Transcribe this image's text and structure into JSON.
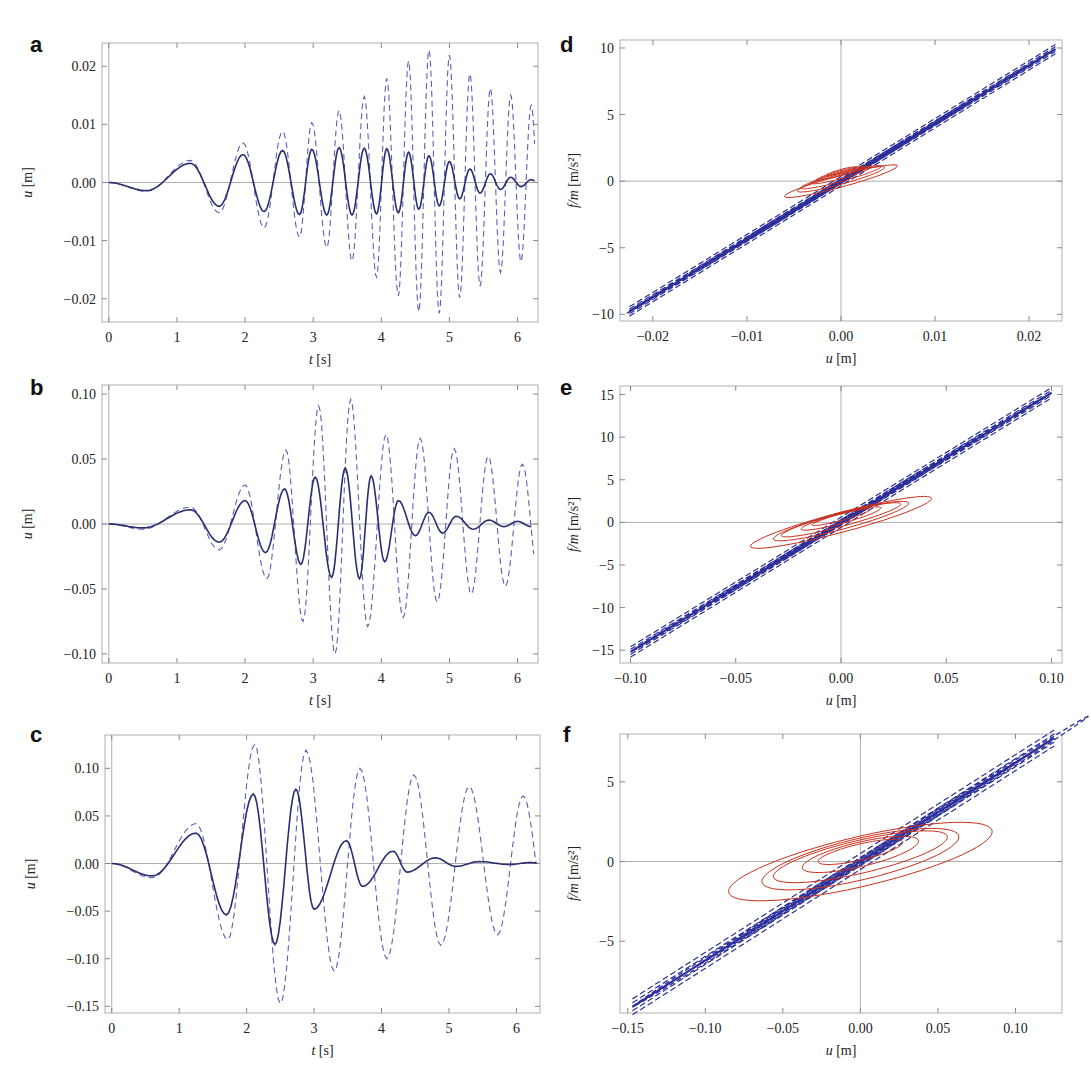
{
  "colors": {
    "dashed_blue": "#5a5fb8",
    "solid_navy": "#2a2d6e",
    "loop_blue": "#2c2f9a",
    "loop_red": "#c8301c",
    "frame": "#b0b0b0",
    "zero_line": "#999999"
  },
  "panels": [
    {
      "id": "a",
      "letter": "a",
      "xlabel_italic": "t",
      "xlabel_unit": "[s]",
      "ylabel_italic": "u",
      "ylabel_unit": "[m]"
    },
    {
      "id": "b",
      "letter": "b",
      "xlabel_italic": "t",
      "xlabel_unit": "[s]",
      "ylabel_italic": "u",
      "ylabel_unit": "[m]"
    },
    {
      "id": "c",
      "letter": "c",
      "xlabel_italic": "t",
      "xlabel_unit": "[s]",
      "ylabel_italic": "u",
      "ylabel_unit": "[m]"
    },
    {
      "id": "d",
      "letter": "d",
      "xlabel_italic": "u",
      "xlabel_unit": "[m]",
      "ylabel_italic": "f/m",
      "ylabel_unit": "[m/s²]"
    },
    {
      "id": "e",
      "letter": "e",
      "xlabel_italic": "u",
      "xlabel_unit": "[m]",
      "ylabel_italic": "f/m",
      "ylabel_unit": "[m/s²]"
    },
    {
      "id": "f",
      "letter": "f",
      "xlabel_italic": "u",
      "xlabel_unit": "[m]",
      "ylabel_italic": "f/m",
      "ylabel_unit": "[m/s²]"
    }
  ],
  "chart_data": [
    {
      "panel": "a",
      "type": "line",
      "title": "",
      "xlabel": "t [s]",
      "ylabel": "u [m]",
      "xlim": [
        -0.1,
        6.3
      ],
      "ylim": [
        -0.024,
        0.024
      ],
      "xticks": [
        "0",
        "1",
        "2",
        "3",
        "4",
        "5",
        "6"
      ],
      "yticks": [
        "-0.02",
        "-0.01",
        "0.00",
        "0.01",
        "0.02"
      ],
      "series": [
        {
          "name": "dashed (uncontrolled)",
          "style": "dashed",
          "peaks_t": [
            0.55,
            1.2,
            1.62,
            1.97,
            2.28,
            2.55,
            2.8,
            2.98,
            3.2,
            3.38,
            3.57,
            3.75,
            3.93,
            4.08,
            4.25,
            4.4,
            4.55,
            4.7,
            4.85,
            5.0,
            5.15,
            5.3,
            5.45,
            5.6,
            5.75,
            5.9,
            6.05,
            6.2
          ],
          "peaks_u": [
            -0.0015,
            0.0038,
            -0.0052,
            0.0068,
            -0.0078,
            0.0088,
            -0.0094,
            0.0103,
            -0.0112,
            0.0124,
            -0.0135,
            0.0148,
            -0.0163,
            0.0179,
            -0.0195,
            0.0209,
            -0.0222,
            0.0228,
            -0.0225,
            0.0219,
            -0.0198,
            0.0187,
            -0.0178,
            0.0162,
            -0.0155,
            0.015,
            -0.0136,
            0.0133
          ]
        },
        {
          "name": "solid (controlled)",
          "style": "solid",
          "peaks_t": [
            0.55,
            1.2,
            1.62,
            1.97,
            2.28,
            2.55,
            2.8,
            2.98,
            3.2,
            3.38,
            3.57,
            3.75,
            3.93,
            4.08,
            4.25,
            4.4,
            4.55,
            4.7,
            4.85,
            5.0,
            5.15,
            5.3,
            5.45,
            5.6,
            5.75,
            5.9,
            6.05,
            6.2
          ],
          "peaks_u": [
            -0.0014,
            0.0033,
            -0.0041,
            0.0048,
            -0.005,
            0.0055,
            -0.0055,
            0.0057,
            -0.0056,
            0.006,
            -0.0056,
            0.0059,
            -0.0054,
            0.0058,
            -0.0052,
            0.0052,
            -0.0046,
            0.0046,
            -0.004,
            0.0036,
            -0.0028,
            0.0023,
            -0.0018,
            0.0015,
            -0.0012,
            0.0009,
            -0.0007,
            0.0005
          ]
        }
      ]
    },
    {
      "panel": "b",
      "type": "line",
      "xlabel": "t [s]",
      "ylabel": "u [m]",
      "xlim": [
        -0.1,
        6.3
      ],
      "ylim": [
        -0.107,
        0.107
      ],
      "xticks": [
        "0",
        "1",
        "2",
        "3",
        "4",
        "5",
        "6"
      ],
      "yticks": [
        "-0.10",
        "-0.05",
        "0.00",
        "0.05",
        "0.10"
      ],
      "series": [
        {
          "name": "dashed (uncontrolled)",
          "style": "dashed",
          "peaks_t": [
            0.5,
            1.2,
            1.62,
            2.0,
            2.32,
            2.6,
            2.85,
            3.08,
            3.32,
            3.55,
            3.8,
            4.07,
            4.32,
            4.57,
            4.82,
            5.07,
            5.32,
            5.57,
            5.82,
            6.07
          ],
          "peaks_u": [
            -0.004,
            0.013,
            -0.02,
            0.03,
            -0.042,
            0.057,
            -0.075,
            0.091,
            -0.1,
            0.096,
            -0.079,
            0.069,
            -0.072,
            0.066,
            -0.06,
            0.058,
            -0.054,
            0.052,
            -0.048,
            0.046
          ]
        },
        {
          "name": "solid (controlled)",
          "style": "solid",
          "peaks_t": [
            0.5,
            1.2,
            1.62,
            2.0,
            2.3,
            2.58,
            2.82,
            3.03,
            3.27,
            3.47,
            3.68,
            3.85,
            4.05,
            4.25,
            4.5,
            4.7,
            4.9,
            5.1,
            5.35,
            5.58,
            5.8,
            6.0
          ],
          "peaks_u": [
            -0.003,
            0.011,
            -0.014,
            0.018,
            -0.022,
            0.027,
            -0.031,
            0.036,
            -0.041,
            0.043,
            -0.042,
            0.037,
            -0.029,
            0.018,
            -0.009,
            0.009,
            -0.007,
            0.006,
            -0.004,
            0.003,
            -0.002,
            0.002
          ]
        }
      ]
    },
    {
      "panel": "c",
      "type": "line",
      "xlabel": "t [s]",
      "ylabel": "u [m]",
      "xlim": [
        -0.1,
        6.35
      ],
      "ylim": [
        -0.157,
        0.135
      ],
      "xticks": [
        "0",
        "1",
        "2",
        "3",
        "4",
        "5",
        "6"
      ],
      "yticks": [
        "-0.15",
        "-0.10",
        "-0.05",
        "0.00",
        "0.05",
        "0.10"
      ],
      "series": [
        {
          "name": "dashed (uncontrolled)",
          "style": "dashed",
          "peaks_t": [
            0.6,
            1.25,
            1.72,
            2.12,
            2.5,
            2.88,
            3.3,
            3.68,
            4.08,
            4.48,
            4.88,
            5.3,
            5.72,
            6.1
          ],
          "peaks_u": [
            -0.015,
            0.042,
            -0.08,
            0.125,
            -0.147,
            0.119,
            -0.113,
            0.1,
            -0.1,
            0.093,
            -0.086,
            0.081,
            -0.075,
            0.071
          ]
        },
        {
          "name": "solid (controlled)",
          "style": "solid",
          "peaks_t": [
            0.6,
            1.25,
            1.7,
            2.1,
            2.42,
            2.73,
            3.0,
            3.48,
            3.72,
            4.17,
            4.38,
            4.8,
            5.1,
            5.45,
            5.9,
            6.2
          ],
          "peaks_u": [
            -0.013,
            0.032,
            -0.054,
            0.073,
            -0.085,
            0.078,
            -0.048,
            0.024,
            -0.024,
            0.013,
            -0.009,
            0.006,
            -0.003,
            0.002,
            -0.001,
            0.001
          ]
        }
      ]
    },
    {
      "panel": "d",
      "type": "line",
      "xlabel": "u [m]",
      "ylabel": "f/m [m/s²]",
      "xlim": [
        -0.0235,
        0.0235
      ],
      "ylim": [
        -10.5,
        10.6
      ],
      "xticks": [
        "-0.02",
        "-0.01",
        "0.00",
        "0.01",
        "0.02"
      ],
      "yticks": [
        "-10",
        "-5",
        "0",
        "5",
        "10"
      ],
      "series": [
        {
          "name": "blue dashed hysteresis (stiff)",
          "style": "dashed",
          "slope": 435,
          "u_range": [
            -0.0225,
            0.0228
          ],
          "loop_width": 0.35
        },
        {
          "name": "red hysteresis (controlled)",
          "style": "solid",
          "slope": 190,
          "u_range": [
            -0.006,
            0.006
          ],
          "loop_width": 0.45
        }
      ]
    },
    {
      "panel": "e",
      "type": "line",
      "xlabel": "u [m]",
      "ylabel": "f/m [m/s²]",
      "xlim": [
        -0.105,
        0.105
      ],
      "ylim": [
        -16.5,
        16.0
      ],
      "xticks": [
        "-0.10",
        "-0.05",
        "0.00",
        "0.05",
        "0.10"
      ],
      "yticks": [
        "-15",
        "-10",
        "-5",
        "0",
        "5",
        "10",
        "15"
      ],
      "series": [
        {
          "name": "blue dashed hysteresis (stiff)",
          "style": "dashed",
          "slope": 152,
          "u_range": [
            -0.1,
            0.1
          ],
          "loop_width": 0.6
        },
        {
          "name": "red hysteresis (controlled)",
          "style": "solid",
          "slope": 65,
          "u_range": [
            -0.043,
            0.043
          ],
          "loop_width": 1.2
        }
      ]
    },
    {
      "panel": "f",
      "type": "line",
      "xlabel": "u [m]",
      "ylabel": "f/m [m/s²]",
      "xlim": [
        -0.155,
        0.13
      ],
      "ylim": [
        -9.5,
        8.0
      ],
      "xticks": [
        "-0.15",
        "-0.10",
        "-0.05",
        "0.00",
        "0.05",
        "0.10"
      ],
      "yticks": [
        "-5",
        "0",
        "5"
      ],
      "series": [
        {
          "name": "blue dashed hysteresis (stiff)",
          "style": "dashed",
          "slope": 62,
          "u_range": [
            -0.147,
            0.125
          ],
          "loop_width": 0.5
        },
        {
          "name": "red hysteresis (controlled)",
          "style": "solid",
          "slope": 22,
          "u_range": [
            -0.085,
            0.078
          ],
          "loop_width": 1.6
        }
      ]
    }
  ]
}
